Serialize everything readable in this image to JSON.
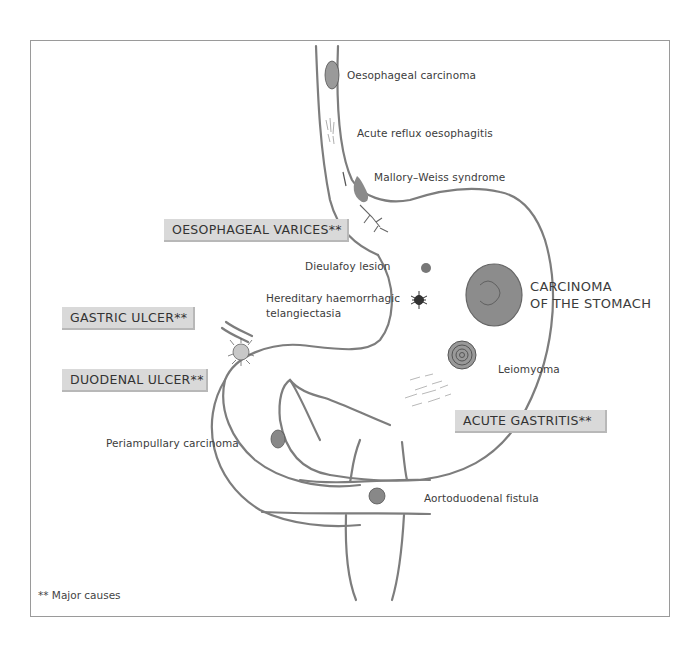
{
  "diagram": {
    "title": "",
    "major_causes": [
      {
        "id": "oesophageal_varices",
        "label": "OESOPHAGEAL VARICES**"
      },
      {
        "id": "gastric_ulcer",
        "label": "GASTRIC ULCER**"
      },
      {
        "id": "duodenal_ulcer",
        "label": "DUODENAL ULCER**"
      },
      {
        "id": "acute_gastritis",
        "label": "ACUTE GASTRITIS**"
      }
    ],
    "other_causes": [
      {
        "id": "oesophageal_carcinoma",
        "label": "Oesophageal carcinoma"
      },
      {
        "id": "acute_reflux",
        "label": "Acute reflux oesophagitis"
      },
      {
        "id": "mallory_weiss",
        "label": "Mallory–Weiss syndrome"
      },
      {
        "id": "dieulafoy",
        "label": "Dieulafoy  lesion"
      },
      {
        "id": "hht_line1",
        "label": "Hereditary haemorrhagic"
      },
      {
        "id": "hht_line2",
        "label": "telangiectasia"
      },
      {
        "id": "leiomyoma",
        "label": "Leiomyoma"
      },
      {
        "id": "periampullary",
        "label": "Periampullary  carcinoma"
      },
      {
        "id": "aortoduodenal",
        "label": "Aortoduodenal fistula"
      }
    ],
    "carcinoma_stomach": {
      "line1": "CARCINOMA",
      "line2": "OF THE STOMACH"
    },
    "footnote": "** Major causes"
  },
  "colors": {
    "outline": "#7a7a7a",
    "lesion_fill": "#8a8a8a",
    "box_fill": "#d9d9d9",
    "text": "#3c3c3c"
  }
}
